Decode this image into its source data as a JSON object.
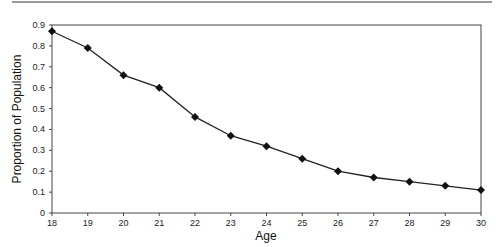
{
  "chart_data": {
    "type": "line",
    "title": "",
    "xlabel": "Age",
    "ylabel": "Proportion of Population",
    "x": [
      18,
      19,
      20,
      21,
      22,
      23,
      24,
      25,
      26,
      27,
      28,
      29,
      30
    ],
    "series": [
      {
        "name": "Proportion of Population",
        "values": [
          0.87,
          0.79,
          0.66,
          0.6,
          0.46,
          0.37,
          0.32,
          0.26,
          0.2,
          0.17,
          0.15,
          0.13,
          0.11
        ]
      }
    ],
    "xlim": [
      18,
      30
    ],
    "ylim": [
      0,
      0.9
    ],
    "yticks": [
      "0",
      "0.1",
      "0.2",
      "0.3",
      "0.4",
      "0.5",
      "0.6",
      "0.7",
      "0.8",
      "0.9"
    ],
    "xticks": [
      "18",
      "19",
      "20",
      "21",
      "22",
      "23",
      "24",
      "25",
      "26",
      "27",
      "28",
      "29",
      "30"
    ],
    "grid": false,
    "legend": null,
    "marker": "diamond",
    "line_color": "#222222"
  }
}
